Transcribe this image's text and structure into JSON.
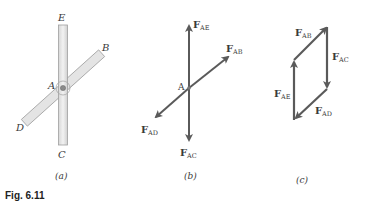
{
  "figure": {
    "caption": "Fig. 6.11",
    "colors": {
      "bar_fill": "#e6e6e6",
      "bar_stroke": "#9a9a9a",
      "arrow": "#5a5a5a",
      "text": "#3a3a3a"
    },
    "panel_a": {
      "sublabel": "(a)",
      "points": {
        "E": "E",
        "B": "B",
        "A": "A",
        "D": "D",
        "C": "C"
      }
    },
    "panel_b": {
      "sublabel": "(b)",
      "point_label": "A",
      "forces": [
        {
          "id": "FAE",
          "main": "F",
          "sub": "AE"
        },
        {
          "id": "FAB",
          "main": "F",
          "sub": "AB"
        },
        {
          "id": "FAD",
          "main": "F",
          "sub": "AD"
        },
        {
          "id": "FAC",
          "main": "F",
          "sub": "AC"
        }
      ]
    },
    "panel_c": {
      "sublabel": "(c)",
      "forces": [
        {
          "id": "FAB",
          "main": "F",
          "sub": "AB"
        },
        {
          "id": "FAC",
          "main": "F",
          "sub": "AC"
        },
        {
          "id": "FAE",
          "main": "F",
          "sub": "AE"
        },
        {
          "id": "FAD",
          "main": "F",
          "sub": "AD"
        }
      ]
    }
  }
}
